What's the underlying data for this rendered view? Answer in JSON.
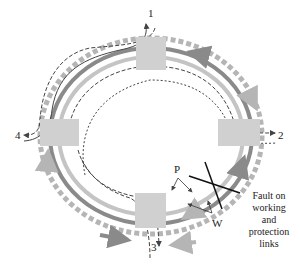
{
  "diagram": {
    "type": "ring-network-protection",
    "nodes": [
      {
        "id": "1",
        "label": "1"
      },
      {
        "id": "2",
        "label": "2"
      },
      {
        "id": "3",
        "label": "3"
      },
      {
        "id": "4",
        "label": "4"
      }
    ],
    "annotations": {
      "protection": "P",
      "working": "W",
      "fault_line1": "Fault on",
      "fault_line2": "working",
      "fault_line3": "and",
      "fault_line4": "protection",
      "fault_line5": "links"
    },
    "colors": {
      "node_fill": "#d0d0d0",
      "working": "#8a8a8a",
      "protection": "#b5b5b5",
      "path_line": "#444444",
      "fault_mark": "#111111"
    }
  }
}
